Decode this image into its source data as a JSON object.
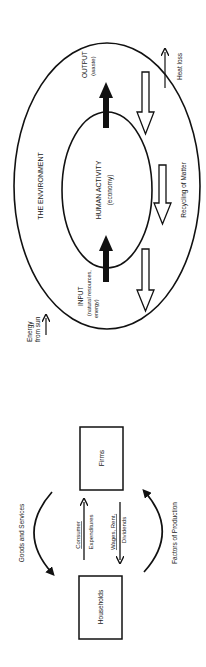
{
  "environment_diagram": {
    "outer_label": "THE ENVIRONMENT",
    "inner_label": "HUMAN ACTIVITY",
    "inner_sublabel": "(economy)",
    "input_label": "INPUT",
    "input_sublabel_1": "(natural resources,",
    "input_sublabel_2": "energy)",
    "output_label": "OUTPUT",
    "output_sublabel": "(waste)",
    "recycling_label": "Recycling of Matter",
    "heat_loss_label": "Heat loss",
    "energy_label_1": "Energy",
    "energy_label_2": "from sun"
  },
  "circular_flow": {
    "households_label": "Households",
    "firms_label": "Firms",
    "goods_label": "Goods and Services",
    "factors_label": "Factors of Production",
    "consumer_label_1": "Consumer",
    "consumer_label_2": "Expenditures",
    "wages_label_1": "Wages, Rent,",
    "wages_label_2": "Dividends"
  },
  "colors": {
    "stroke": "#111111",
    "background": "#ffffff"
  }
}
